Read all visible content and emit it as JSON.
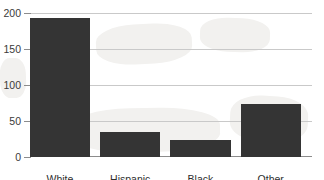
{
  "chart_data": {
    "type": "bar",
    "title": "",
    "xlabel": "",
    "ylabel": "",
    "categories": [
      "White",
      "Hispanic",
      "Black",
      "Other"
    ],
    "values": [
      193,
      35,
      24,
      74
    ],
    "ylim": [
      0,
      200
    ],
    "yticks": [
      0,
      50,
      100,
      150,
      200
    ],
    "ytick_labels": [
      "0",
      "50",
      "100",
      "150",
      "200"
    ],
    "grid": true,
    "legend": false,
    "orientation": "vertical",
    "bar_color": "#343434",
    "gridline_color": "#c9c9c9",
    "axis_color": "#8c8c8c",
    "background_color": "#ffffff"
  }
}
